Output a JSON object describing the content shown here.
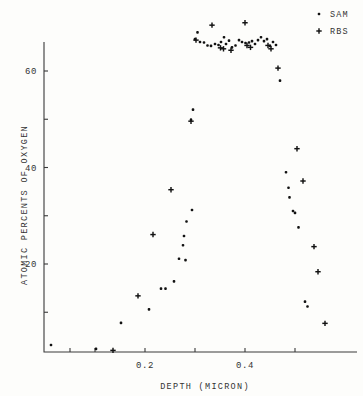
{
  "chart_data": {
    "type": "scatter",
    "title": "",
    "xlabel": "DEPTH (MICRON)",
    "ylabel": "ATOMIC PERCENTS OF OXYGEN",
    "xlim": [
      0.0,
      0.58
    ],
    "ylim": [
      0,
      72
    ],
    "grid": false,
    "legend_position": "top-right",
    "x_ticks_labeled": [
      0.2,
      0.4
    ],
    "x_ticks_minor": [
      0.05,
      0.1,
      0.3,
      0.5
    ],
    "y_ticks_labeled": [
      20,
      40,
      60
    ],
    "y_ticks_minor": [
      10,
      30,
      50,
      70
    ],
    "x_tick_labels": [
      "0.2",
      "0.4"
    ],
    "y_tick_labels": [
      "20",
      "40",
      "60"
    ],
    "series": [
      {
        "name": "SAM",
        "marker": "dot",
        "points": [
          [
            0.012,
            3.2
          ],
          [
            0.102,
            2.4
          ],
          [
            0.152,
            7.8
          ],
          [
            0.208,
            10.6
          ],
          [
            0.232,
            14.9
          ],
          [
            0.241,
            14.9
          ],
          [
            0.258,
            16.4
          ],
          [
            0.268,
            21.1
          ],
          [
            0.281,
            20.8
          ],
          [
            0.276,
            23.9
          ],
          [
            0.278,
            25.8
          ],
          [
            0.283,
            28.8
          ],
          [
            0.294,
            31.2
          ],
          [
            0.292,
            49.9
          ],
          [
            0.296,
            52.0
          ],
          [
            0.3,
            66.6
          ],
          [
            0.305,
            68.0
          ],
          [
            0.31,
            66.0
          ],
          [
            0.318,
            65.9
          ],
          [
            0.325,
            65.3
          ],
          [
            0.332,
            65.2
          ],
          [
            0.34,
            65.6
          ],
          [
            0.347,
            65.4
          ],
          [
            0.352,
            66.0
          ],
          [
            0.358,
            67.0
          ],
          [
            0.362,
            65.6
          ],
          [
            0.368,
            66.3
          ],
          [
            0.374,
            64.9
          ],
          [
            0.381,
            65.3
          ],
          [
            0.388,
            66.4
          ],
          [
            0.394,
            66.0
          ],
          [
            0.401,
            65.8
          ],
          [
            0.408,
            65.9
          ],
          [
            0.414,
            66.2
          ],
          [
            0.42,
            65.6
          ],
          [
            0.426,
            66.4
          ],
          [
            0.432,
            67.0
          ],
          [
            0.438,
            66.2
          ],
          [
            0.444,
            66.6
          ],
          [
            0.45,
            65.2
          ],
          [
            0.456,
            66.0
          ],
          [
            0.462,
            65.4
          ],
          [
            0.47,
            58.0
          ],
          [
            0.482,
            39.0
          ],
          [
            0.487,
            35.8
          ],
          [
            0.489,
            33.8
          ],
          [
            0.496,
            31.0
          ],
          [
            0.5,
            30.6
          ],
          [
            0.507,
            27.6
          ],
          [
            0.52,
            12.2
          ],
          [
            0.525,
            11.2
          ]
        ]
      },
      {
        "name": "RBS",
        "marker": "plus",
        "points": [
          [
            0.136,
            2.1
          ],
          [
            0.186,
            13.4
          ],
          [
            0.216,
            26.1
          ],
          [
            0.252,
            35.4
          ],
          [
            0.292,
            49.6
          ],
          [
            0.302,
            66.4
          ],
          [
            0.334,
            69.5
          ],
          [
            0.351,
            64.8
          ],
          [
            0.357,
            64.6
          ],
          [
            0.372,
            64.3
          ],
          [
            0.4,
            70.0
          ],
          [
            0.404,
            65.3
          ],
          [
            0.411,
            64.9
          ],
          [
            0.446,
            65.3
          ],
          [
            0.452,
            64.6
          ],
          [
            0.466,
            60.6
          ],
          [
            0.504,
            43.9
          ],
          [
            0.516,
            37.2
          ],
          [
            0.538,
            23.6
          ],
          [
            0.546,
            18.4
          ],
          [
            0.56,
            7.7
          ]
        ]
      }
    ]
  },
  "legend": {
    "entries": [
      {
        "label": "SAM",
        "marker": "dot"
      },
      {
        "label": "RBS",
        "marker": "plus"
      }
    ]
  },
  "colors": {
    "ink": "#121212",
    "axis": "#3a3a3a",
    "background": "#fdfdfb"
  }
}
